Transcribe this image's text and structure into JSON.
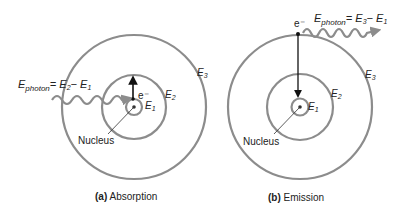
{
  "colors": {
    "orbit": "#8c8c8c",
    "text": "#222222",
    "arrow": "#111111",
    "photon": "#8c8c8c"
  },
  "panel_a": {
    "caption_letter": "(a)",
    "caption_text": "Absorption",
    "photon_label_main": "E",
    "photon_label_sub": "photon",
    "photon_eq": "= E",
    "photon_eq_sub1": "2",
    "photon_minus": "− E",
    "photon_eq_sub2": "1",
    "electron": "e⁻",
    "levels": [
      {
        "name": "E",
        "sub": "1"
      },
      {
        "name": "E",
        "sub": "2"
      },
      {
        "name": "E",
        "sub": "3"
      }
    ],
    "nucleus": "Nucleus"
  },
  "panel_b": {
    "caption_letter": "(b)",
    "caption_text": "Emission",
    "photon_label_main": "E",
    "photon_label_sub": "photon",
    "photon_eq": "= E",
    "photon_eq_sub1": "3",
    "photon_minus": "− E",
    "photon_eq_sub2": "1",
    "electron": "e⁻",
    "levels": [
      {
        "name": "E",
        "sub": "1"
      },
      {
        "name": "E",
        "sub": "2"
      },
      {
        "name": "E",
        "sub": "3"
      }
    ],
    "nucleus": "Nucleus"
  }
}
